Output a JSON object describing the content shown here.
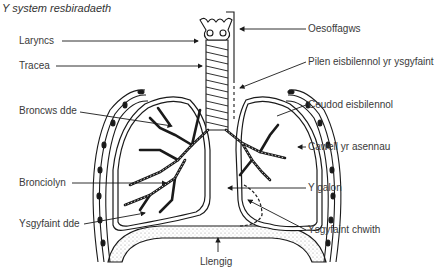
{
  "title": "Y system resbiradaeth",
  "labels": {
    "larynx": "Laryncs",
    "trachea": "Tracea",
    "right_bronchus": "Broncws dde",
    "bronchiole": "Bronciolyn",
    "right_lung": "Ysgyfaint dde",
    "diaphragm": "Llengig",
    "oesophagus": "Oesoffagws",
    "pleural_membrane": "Pilen eisbilennol yr ysgyfaint",
    "pleural_cavity": "Ceudod eisbilennol",
    "rib_cage": "Cawell yr asennau",
    "heart": "Y galon",
    "left_lung": "Ysgyfaint chwith"
  },
  "colors": {
    "line": "#1a1a1a",
    "text": "#3a3a3a",
    "stipple": "#9a9a9a"
  }
}
